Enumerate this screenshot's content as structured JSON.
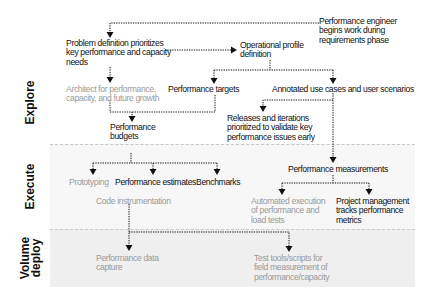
{
  "phases": {
    "explore": "Explore",
    "execute": "Execute",
    "deploy_line1": "Volume",
    "deploy_line2": "deploy"
  },
  "nodes": {
    "perf_engineer": [
      "Performance engineer",
      "begins work during",
      "requirements phase"
    ],
    "problem_definition": [
      "Problem definition prioritizes",
      "key performance and capacity",
      "needs"
    ],
    "operational_profile": [
      "Operational profile",
      "definition"
    ],
    "architect": [
      "Architect for performance,",
      "capacity, and future growth"
    ],
    "performance_targets": "Performance targets",
    "annotated_use_cases": "Annotated use cases and user scenarios",
    "releases_iterations": [
      "Releases and iterations",
      "prioritized to validate key",
      "performance issues early"
    ],
    "performance_budgets": [
      "Performance",
      "budgets"
    ],
    "prototyping": "Prototyping",
    "performance_estimates": "Performance estimates",
    "benchmarks": "Benchmarks",
    "code_instrumentation": "Code instrumentation",
    "performance_measurements": "Performance measurements",
    "automated_execution": [
      "Automated execution",
      "of performance and",
      "load tests"
    ],
    "project_management": [
      "Project management",
      "tracks performance",
      "metrics"
    ],
    "performance_data_capture": [
      "Performance data",
      "capture"
    ],
    "test_tools": [
      "Test tools/scripts for",
      "field measurement of",
      "performance/capacity"
    ]
  },
  "colors": {
    "primary_text": "#111111",
    "secondary_text": "#9a9a9a",
    "execute_band": "#f7f7f7",
    "deploy_band": "#efefef",
    "connector": "#111111"
  }
}
